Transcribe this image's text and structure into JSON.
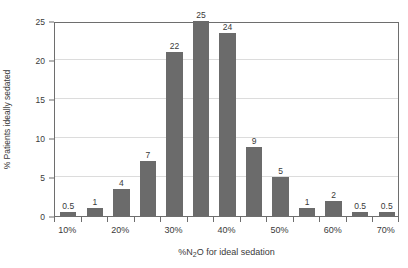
{
  "chart_data": {
    "type": "bar",
    "title": "",
    "xlabel": "%N2O for ideal sedation",
    "xlabel_parts": {
      "pre": "%N",
      "sub": "2",
      "post": "O for ideal sedation"
    },
    "ylabel": "% Patients ideally sedated",
    "ylim": [
      0,
      25
    ],
    "ytick_labels": [
      "0",
      "5",
      "10",
      "15",
      "20",
      "25"
    ],
    "ytick_values": [
      0,
      5,
      10,
      15,
      20,
      25
    ],
    "xtick_labels": [
      "10%",
      "20%",
      "30%",
      "40%",
      "50%",
      "60%",
      "70%"
    ],
    "grid": true,
    "legend": "none",
    "categories": [
      "10%",
      "",
      "20%",
      "",
      "30%",
      "",
      "40%",
      "",
      "50%",
      "",
      "60%",
      "",
      "70%"
    ],
    "values": [
      0.5,
      1,
      4,
      7,
      22,
      25,
      24,
      9,
      5,
      1,
      2,
      0.5,
      0.5
    ],
    "bar_heights": [
      0.5,
      1,
      3.5,
      7,
      21,
      25,
      23.4,
      8.8,
      5,
      1,
      1.9,
      0.5,
      0.5
    ],
    "data_labels": [
      "0.5",
      "1",
      "4",
      "7",
      "22",
      "25",
      "24",
      "9",
      "5",
      "1",
      "2",
      "0.5",
      "0.5"
    ],
    "bar_color": "#6b6b6b",
    "grid_color": "#dcdcdc",
    "axis_color": "#6e6e6e"
  }
}
